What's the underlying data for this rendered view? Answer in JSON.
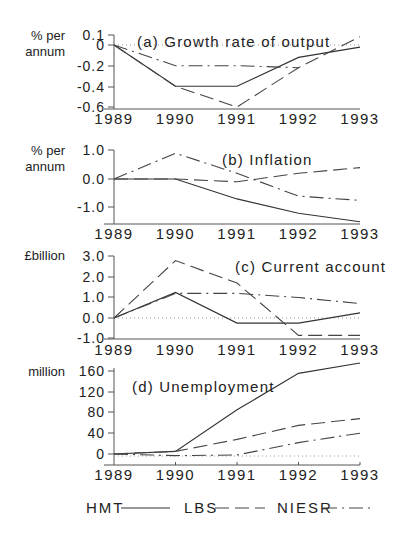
{
  "figure": {
    "legend": [
      {
        "label": "HMT",
        "style": "solid"
      },
      {
        "label": "LBS",
        "style": "dashed"
      },
      {
        "label": "NIESR",
        "style": "dash-dot"
      }
    ]
  },
  "chart_data": [
    {
      "type": "line",
      "title": "(a) Growth rate of output",
      "ylabel": "% per annum",
      "xlabel": "",
      "x": [
        1989,
        1990,
        1991,
        1992,
        1993
      ],
      "yticks": [
        "0.1",
        "0",
        "-0.2",
        "-0.4",
        "-0.6"
      ],
      "ylim": [
        -0.6,
        0.1
      ],
      "series": [
        {
          "name": "HMT",
          "values": [
            0.0,
            -0.4,
            -0.4,
            -0.12,
            -0.02
          ]
        },
        {
          "name": "LBS",
          "values": [
            0.0,
            -0.4,
            -0.6,
            -0.22,
            0.08
          ]
        },
        {
          "name": "NIESR",
          "values": [
            0.0,
            -0.2,
            -0.2,
            -0.22,
            null
          ]
        }
      ]
    },
    {
      "type": "line",
      "title": "(b) Inflation",
      "ylabel": "% per annum",
      "xlabel": "",
      "x": [
        1989,
        1990,
        1991,
        1992,
        1993
      ],
      "yticks": [
        "1.0",
        "0.0",
        "-1.0"
      ],
      "ylim": [
        -1.5,
        1.0
      ],
      "series": [
        {
          "name": "HMT",
          "values": [
            0.0,
            0.0,
            -0.7,
            -1.2,
            -1.5
          ]
        },
        {
          "name": "LBS",
          "values": [
            0.0,
            0.0,
            -0.1,
            0.2,
            0.4
          ]
        },
        {
          "name": "NIESR",
          "values": [
            0.0,
            0.9,
            0.2,
            -0.6,
            -0.75
          ]
        }
      ]
    },
    {
      "type": "line",
      "title": "(c) Current account",
      "ylabel": "£billion",
      "xlabel": "",
      "x": [
        1989,
        1990,
        1991,
        1992,
        1993
      ],
      "yticks": [
        "3.0",
        "2.0",
        "1.0",
        "0.0",
        "-1.0"
      ],
      "ylim": [
        -1.0,
        3.0
      ],
      "series": [
        {
          "name": "HMT",
          "values": [
            0.0,
            1.25,
            -0.25,
            -0.25,
            0.25
          ]
        },
        {
          "name": "LBS",
          "values": [
            0.0,
            2.8,
            1.7,
            -0.85,
            -0.85
          ]
        },
        {
          "name": "NIESR",
          "values": [
            0.0,
            1.2,
            1.2,
            1.0,
            0.7
          ]
        }
      ]
    },
    {
      "type": "line",
      "title": "(d) Unemployment",
      "ylabel": "million",
      "xlabel": "",
      "x": [
        1989,
        1990,
        1991,
        1992,
        1993
      ],
      "yticks": [
        "160",
        "120",
        "80",
        "40",
        "0"
      ],
      "ylim": [
        -8,
        160
      ],
      "series": [
        {
          "name": "HMT",
          "values": [
            0,
            5,
            85,
            155,
            175
          ]
        },
        {
          "name": "LBS",
          "values": [
            0,
            5,
            28,
            55,
            68
          ]
        },
        {
          "name": "NIESR",
          "values": [
            0,
            -3,
            -2,
            22,
            40
          ]
        }
      ]
    }
  ]
}
